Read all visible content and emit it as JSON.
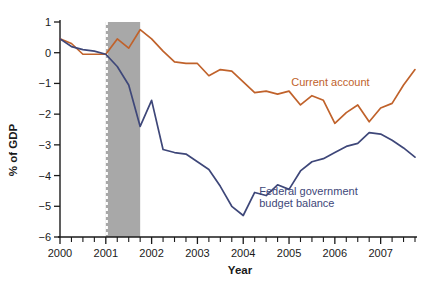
{
  "chart_data": {
    "type": "line",
    "title": "",
    "xlabel": "Year",
    "ylabel": "% of GDP",
    "ylim": [
      -6,
      1
    ],
    "xlim": [
      2000.0,
      2007.75
    ],
    "yticks": [
      1,
      0,
      -1,
      -2,
      -3,
      -4,
      -5,
      -6
    ],
    "ytick_labels": [
      "1",
      "0",
      "−1",
      "−2",
      "−3",
      "−4",
      "−5",
      "−6"
    ],
    "xticks": [
      2000,
      2001,
      2002,
      2003,
      2004,
      2005,
      2006,
      2007
    ],
    "xtick_labels": [
      "2000",
      "2001",
      "2002",
      "2003",
      "2004",
      "2005",
      "2006",
      "2007"
    ],
    "minor_xtick_interval": 0.25,
    "grid": false,
    "legend": "inline-annotations",
    "shaded_region": {
      "label": "recession",
      "x_start": 2001.0,
      "x_end": 2001.75,
      "fill": "#a8a8a8",
      "left_edge_style": "white-dashed"
    },
    "x": [
      2000.0,
      2000.25,
      2000.5,
      2000.75,
      2001.0,
      2001.25,
      2001.5,
      2001.75,
      2002.0,
      2002.25,
      2002.5,
      2002.75,
      2003.0,
      2003.25,
      2003.5,
      2003.75,
      2004.0,
      2004.25,
      2004.5,
      2004.75,
      2005.0,
      2005.25,
      2005.5,
      2005.75,
      2006.0,
      2006.25,
      2006.5,
      2006.75,
      2007.0,
      2007.25,
      2007.5,
      2007.75
    ],
    "series": [
      {
        "name": "Current account",
        "color": "#c0622b",
        "label_x": 2005.05,
        "label_y": -1.08,
        "values": [
          0.45,
          0.3,
          -0.05,
          -0.05,
          -0.05,
          0.45,
          0.15,
          0.75,
          0.45,
          0.05,
          -0.3,
          -0.35,
          -0.35,
          -0.75,
          -0.55,
          -0.6,
          -0.95,
          -1.3,
          -1.25,
          -1.35,
          -1.25,
          -1.7,
          -1.4,
          -1.55,
          -2.3,
          -1.95,
          -1.7,
          -2.25,
          -1.8,
          -1.65,
          -1.05,
          -0.55
        ]
      },
      {
        "name": "Federal government budget balance",
        "color": "#3e4779",
        "label_x": 2004.35,
        "label_y": -4.62,
        "label_line2_y": -5.02,
        "label_lines": [
          "Federal government",
          "budget balance"
        ],
        "values": [
          0.45,
          0.2,
          0.1,
          0.05,
          -0.05,
          -0.45,
          -1.05,
          -2.4,
          -1.55,
          -3.15,
          -3.25,
          -3.3,
          -3.55,
          -3.8,
          -4.35,
          -5.0,
          -5.3,
          -4.55,
          -4.65,
          -4.3,
          -4.45,
          -3.85,
          -3.55,
          -3.45,
          -3.25,
          -3.05,
          -2.95,
          -2.6,
          -2.65,
          -2.85,
          -3.1,
          -3.4
        ]
      }
    ]
  }
}
